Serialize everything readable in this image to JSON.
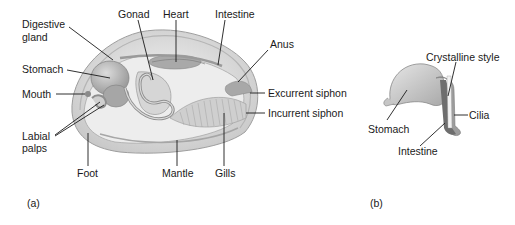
{
  "figure": {
    "panel_a": {
      "id": "(a)",
      "labels": {
        "digestive_gland_1": "Digestive",
        "digestive_gland_2": "gland",
        "gonad": "Gonad",
        "heart": "Heart",
        "intestine": "Intestine",
        "anus": "Anus",
        "stomach": "Stomach",
        "mouth": "Mouth",
        "labial_palps_1": "Labial",
        "labial_palps_2": "palps",
        "excurrent_siphon": "Excurrent siphon",
        "incurrent_siphon": "Incurrent siphon",
        "foot": "Foot",
        "mantle": "Mantle",
        "gills": "Gills"
      }
    },
    "panel_b": {
      "id": "(b)",
      "labels": {
        "crystalline_style": "Crystalline style",
        "stomach": "Stomach",
        "cilia": "Cilia",
        "intestine": "Intestine"
      }
    },
    "colors": {
      "shell": "#d9d9d9",
      "body": "#ececec",
      "organ": "#bdbdbd",
      "organ_dark": "#8f8f8f",
      "leader_line": "#1a1a1a"
    }
  }
}
